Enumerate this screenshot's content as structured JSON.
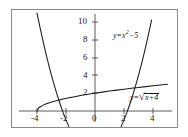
{
  "figure": {
    "name": "function-graph",
    "background_color": "#ffffff",
    "frame_color": "#8a8a8a",
    "curve_color": "#1a1a1a",
    "axis_color": "#4a4a4a"
  },
  "chart_data": {
    "type": "line",
    "title": "",
    "subtitle": "",
    "xlabel": "",
    "ylabel": "",
    "xlim": [
      -4.6,
      5.2
    ],
    "ylim": [
      -1.5,
      11.0
    ],
    "grid": false,
    "legend_position": "inline-annotations",
    "x_ticks": [
      -4,
      -2,
      0,
      2,
      4
    ],
    "x_tick_labels": [
      "-4",
      "-2",
      "0",
      "2",
      "4"
    ],
    "y_ticks": [
      2,
      4,
      6,
      8,
      10
    ],
    "y_tick_labels": [
      "2",
      "4",
      "6",
      "8",
      "10"
    ],
    "series": [
      {
        "name": "parabola",
        "label": "y = x² − 5",
        "equation": "y = x^2 - 5",
        "x": [
          -4.0,
          -3.8,
          -3.6,
          -3.4,
          -3.2,
          -3.0,
          -2.8,
          -2.6,
          -2.4,
          -2.2,
          -2.0,
          -1.8,
          -1.6,
          -1.4,
          -1.2,
          -1.0,
          1.0,
          1.2,
          1.4,
          1.6,
          1.8,
          2.0,
          2.2,
          2.4,
          2.6,
          2.8,
          3.0,
          3.2,
          3.4,
          3.6,
          3.8,
          3.9
        ],
        "y": [
          11.0,
          9.44,
          7.96,
          6.56,
          5.24,
          4.0,
          2.84,
          1.76,
          0.76,
          -0.16,
          -1.0,
          -1.76,
          -2.44,
          -3.04,
          -3.56,
          -4.0,
          -4.0,
          -3.56,
          -3.04,
          -2.44,
          -1.76,
          -1.0,
          -0.16,
          0.76,
          1.76,
          2.84,
          4.0,
          5.24,
          6.56,
          7.96,
          9.44,
          10.21
        ]
      },
      {
        "name": "square-root",
        "label": "y = √(x + 4)",
        "equation": "y = sqrt(x + 4)",
        "x": [
          -4.0,
          -3.9,
          -3.8,
          -3.6,
          -3.4,
          -3.0,
          -2.6,
          -2.2,
          -1.8,
          -1.4,
          -1.0,
          -0.5,
          0.0,
          0.5,
          1.0,
          1.5,
          2.0,
          2.5,
          3.0,
          3.5,
          4.0,
          4.5,
          5.0
        ],
        "y": [
          0.0,
          0.316,
          0.447,
          0.632,
          0.775,
          1.0,
          1.183,
          1.342,
          1.483,
          1.612,
          1.732,
          1.871,
          2.0,
          2.121,
          2.236,
          2.345,
          2.449,
          2.55,
          2.646,
          2.739,
          2.828,
          2.915,
          3.0
        ]
      }
    ],
    "annotations": [
      {
        "name": "parabola-equation-label",
        "text_lhs": "y",
        "text_eq": "=",
        "text_var": "x",
        "text_exp": "2",
        "text_minus": "−",
        "text_const": "5",
        "at_x": 1.3,
        "at_y": 8.6
      },
      {
        "name": "sqrt-equation-label",
        "text_lhs": "y",
        "text_eq": "=",
        "text_radicand_var": "x",
        "text_plus": "+",
        "text_radicand_const": "4",
        "at_x": 3.0,
        "at_y": 1.8
      }
    ]
  },
  "axis_labels": {
    "x": [
      {
        "name": "x-tick-minus4",
        "text": "-4"
      },
      {
        "name": "x-tick-minus2",
        "text": "-2"
      },
      {
        "name": "x-tick-zero",
        "text": "0"
      },
      {
        "name": "x-tick-2",
        "text": "2"
      },
      {
        "name": "x-tick-4",
        "text": "4"
      }
    ],
    "y": [
      {
        "name": "y-tick-10",
        "text": "10"
      },
      {
        "name": "y-tick-8",
        "text": "8"
      },
      {
        "name": "y-tick-6",
        "text": "6"
      },
      {
        "name": "y-tick-4",
        "text": "4"
      },
      {
        "name": "y-tick-2",
        "text": "2"
      }
    ]
  }
}
